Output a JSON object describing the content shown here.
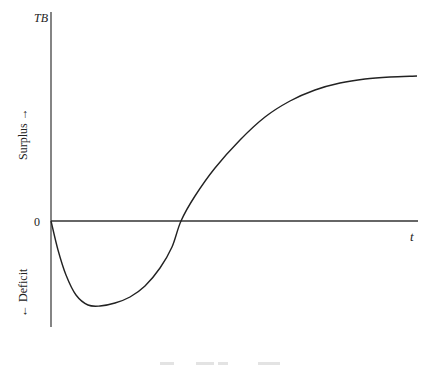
{
  "chart_data": {
    "type": "line",
    "title": "",
    "xlabel": "t",
    "ylabel": "TB",
    "y_upper_label": "Surplus →",
    "y_lower_label": "← Deficit",
    "origin_label": "0",
    "grid": false,
    "legend": null,
    "series": [
      {
        "name": "TB",
        "points_px": [
          [
            51,
            221
          ],
          [
            58,
            250
          ],
          [
            66,
            275
          ],
          [
            76,
            295
          ],
          [
            88,
            305
          ],
          [
            100,
            306
          ],
          [
            115,
            303
          ],
          [
            130,
            297
          ],
          [
            145,
            286
          ],
          [
            160,
            268
          ],
          [
            172,
            247
          ],
          [
            181,
            221
          ],
          [
            195,
            196
          ],
          [
            215,
            168
          ],
          [
            240,
            140
          ],
          [
            265,
            117
          ],
          [
            290,
            101
          ],
          [
            315,
            90
          ],
          [
            340,
            83
          ],
          [
            365,
            79
          ],
          [
            390,
            77
          ],
          [
            417,
            76
          ]
        ]
      }
    ],
    "qualitative_values": {
      "start": 0,
      "minimum": "deficit trough shortly after t=0",
      "zero_crossing": "approx. 1/3 along t axis",
      "end": "surplus plateau"
    },
    "caption": "(caption cut off at bottom edge)"
  },
  "axes": {
    "y_top_label": "TB",
    "x_right_label": "t",
    "zero": "0",
    "surplus": "Surplus →",
    "deficit": "← Deficit"
  },
  "colors": {
    "axis": "#333333",
    "curve": "#222222",
    "text": "#222222",
    "background": "#ffffff"
  }
}
